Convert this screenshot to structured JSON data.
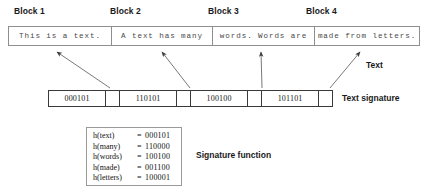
{
  "diagram": {
    "title_labels": [
      {
        "id": "block-1",
        "label": "Block 1",
        "x": 14,
        "y": 6
      },
      {
        "id": "block-2",
        "label": "Block 2",
        "x": 110,
        "y": 6
      },
      {
        "id": "block-3",
        "label": "Block 3",
        "x": 208,
        "y": 6
      },
      {
        "id": "block-4",
        "label": "Block 4",
        "x": 306,
        "y": 6
      }
    ],
    "text_row": {
      "blocks": [
        {
          "id": "text-block-1",
          "text": "This is a text.",
          "width": 102
        },
        {
          "id": "text-block-2",
          "text": "A text has many",
          "width": 101
        },
        {
          "id": "text-block-3",
          "text": "words.  Words are",
          "width": 102
        },
        {
          "id": "text-block-4",
          "text": "made from letters.",
          "width": 105
        }
      ]
    },
    "signature_row": {
      "values": [
        "000101",
        "110101",
        "100100",
        "101101"
      ]
    },
    "captions": {
      "text": "Text",
      "text_signature": "Text signature",
      "signature_function": "Signature function"
    },
    "signature_function": {
      "entries": [
        {
          "key": "h(text)",
          "eq": "=",
          "value": "000101"
        },
        {
          "key": "h(many)",
          "eq": "=",
          "value": "110000"
        },
        {
          "key": "h(words)",
          "eq": "=",
          "value": "100100"
        },
        {
          "key": "h(made)",
          "eq": "=",
          "value": "001100"
        },
        {
          "key": "h(letters)",
          "eq": "=",
          "value": "100001"
        }
      ]
    },
    "arrows": [
      {
        "id": "arrow-block-1",
        "x1": 110,
        "y1": 88,
        "x2": 57,
        "y2": 52
      },
      {
        "id": "arrow-block-2",
        "x1": 190,
        "y1": 88,
        "x2": 162,
        "y2": 52
      },
      {
        "id": "arrow-block-3",
        "x1": 262,
        "y1": 88,
        "x2": 261,
        "y2": 52
      },
      {
        "id": "arrow-block-4",
        "x1": 330,
        "y1": 88,
        "x2": 360,
        "y2": 52
      }
    ],
    "colors": {
      "page_background": "#ffffff",
      "text_row_border": "#8e8e8e",
      "signature_row_border": "#3a3a3a",
      "box_border": "#9a9a9a",
      "label_text": "#1a1a1a",
      "mono_text": "#4a4a4a",
      "arrow": "#555555"
    }
  }
}
